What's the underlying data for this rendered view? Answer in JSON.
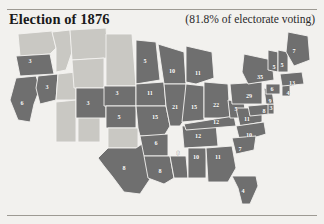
{
  "header": {
    "title": "Election of 1876",
    "turnout_note": "(81.8% of electorate voting)"
  },
  "map": {
    "shaded_color": "#6f6f6f",
    "unshaded_color": "#c9c8c3",
    "border_color": "#f4f3f0",
    "label_color": "#ffffff",
    "states": [
      {
        "code": "WA",
        "name": "Washington Territory",
        "ev": "",
        "shaded": false,
        "lx": 33,
        "ly": 16
      },
      {
        "code": "OR",
        "name": "Oregon",
        "ev": "3",
        "shaded": true,
        "lx": 30,
        "ly": 36
      },
      {
        "code": "CA",
        "name": "California",
        "ev": "6",
        "shaded": true,
        "lx": 22,
        "ly": 78
      },
      {
        "code": "NV",
        "name": "Nevada",
        "ev": "3",
        "shaded": true,
        "lx": 47,
        "ly": 62
      },
      {
        "code": "ID",
        "name": "Idaho Territory",
        "ev": "",
        "shaded": false,
        "lx": 58,
        "ly": 34
      },
      {
        "code": "MT",
        "name": "Montana Territory",
        "ev": "",
        "shaded": false,
        "lx": 78,
        "ly": 20
      },
      {
        "code": "UT",
        "name": "Utah Territory",
        "ev": "",
        "shaded": false,
        "lx": 62,
        "ly": 72
      },
      {
        "code": "AZ",
        "name": "Arizona Territory",
        "ev": "",
        "shaded": false,
        "lx": 55,
        "ly": 103
      },
      {
        "code": "NM",
        "name": "New Mexico Territory",
        "ev": "",
        "shaded": false,
        "lx": 82,
        "ly": 105
      },
      {
        "code": "WY",
        "name": "Wyoming Territory",
        "ev": "",
        "shaded": false,
        "lx": 86,
        "ly": 52
      },
      {
        "code": "CO",
        "name": "Colorado",
        "ev": "3",
        "shaded": true,
        "lx": 88,
        "ly": 78
      },
      {
        "code": "DT",
        "name": "Dakota Territory",
        "ev": "",
        "shaded": false,
        "lx": 114,
        "ly": 36
      },
      {
        "code": "NE",
        "name": "Nebraska",
        "ev": "3",
        "shaded": true,
        "lx": 117,
        "ly": 68
      },
      {
        "code": "KS",
        "name": "Kansas",
        "ev": "5",
        "shaded": true,
        "lx": 119,
        "ly": 92
      },
      {
        "code": "IT",
        "name": "Indian Territory",
        "ev": "",
        "shaded": false,
        "lx": 122,
        "ly": 112
      },
      {
        "code": "TX",
        "name": "Texas",
        "ev": "8",
        "shaded": true,
        "lx": 124,
        "ly": 143
      },
      {
        "code": "MN",
        "name": "Minnesota",
        "ev": "5",
        "shaded": true,
        "lx": 145,
        "ly": 36
      },
      {
        "code": "IA",
        "name": "Iowa",
        "ev": "11",
        "shaded": true,
        "lx": 150,
        "ly": 68
      },
      {
        "code": "MO",
        "name": "Missouri",
        "ev": "15",
        "shaded": true,
        "lx": 155,
        "ly": 92
      },
      {
        "code": "AR",
        "name": "Arkansas",
        "ev": "6",
        "shaded": true,
        "lx": 156,
        "ly": 118
      },
      {
        "code": "LA",
        "name": "Louisiana",
        "ev": "8",
        "shaded": true,
        "lx": 160,
        "ly": 146
      },
      {
        "code": "WI",
        "name": "Wisconsin",
        "ev": "10",
        "shaded": true,
        "lx": 172,
        "ly": 46
      },
      {
        "code": "IL",
        "name": "Illinois",
        "ev": "21",
        "shaded": true,
        "lx": 175,
        "ly": 82
      },
      {
        "code": "MS",
        "name": "Mississippi",
        "ev": "8",
        "shaded": true,
        "lx": 178,
        "ly": 128
      },
      {
        "code": "MI",
        "name": "Michigan",
        "ev": "11",
        "shaded": true,
        "lx": 198,
        "ly": 48
      },
      {
        "code": "IN",
        "name": "Indiana",
        "ev": "15",
        "shaded": true,
        "lx": 194,
        "ly": 82
      },
      {
        "code": "TN",
        "name": "Tennessee",
        "ev": "12",
        "shaded": true,
        "lx": 198,
        "ly": 111
      },
      {
        "code": "AL",
        "name": "Alabama",
        "ev": "10",
        "shaded": true,
        "lx": 196,
        "ly": 132
      },
      {
        "code": "OH",
        "name": "Ohio",
        "ev": "22",
        "shaded": true,
        "lx": 216,
        "ly": 80
      },
      {
        "code": "KY",
        "name": "Kentucky",
        "ev": "12",
        "shaded": true,
        "lx": 216,
        "ly": 97
      },
      {
        "code": "GA",
        "name": "Georgia",
        "ev": "11",
        "shaded": true,
        "lx": 218,
        "ly": 132
      },
      {
        "code": "FL",
        "name": "Florida",
        "ev": "4",
        "shaded": true,
        "lx": 243,
        "ly": 166
      },
      {
        "code": "WV",
        "name": "West Virginia",
        "ev": "5",
        "shaded": true,
        "lx": 236,
        "ly": 84
      },
      {
        "code": "VA",
        "name": "Virginia",
        "ev": "11",
        "shaded": true,
        "lx": 247,
        "ly": 94
      },
      {
        "code": "NC",
        "name": "North Carolina",
        "ev": "10",
        "shaded": true,
        "lx": 249,
        "ly": 110
      },
      {
        "code": "SC",
        "name": "South Carolina",
        "ev": "7",
        "shaded": true,
        "lx": 240,
        "ly": 124
      },
      {
        "code": "PA",
        "name": "Pennsylvania",
        "ev": "29",
        "shaded": true,
        "lx": 249,
        "ly": 71
      },
      {
        "code": "NY",
        "name": "New York",
        "ev": "35",
        "shaded": true,
        "lx": 260,
        "ly": 52
      },
      {
        "code": "MD",
        "name": "Maryland",
        "ev": "8",
        "shaded": true,
        "lx": 264,
        "ly": 86
      },
      {
        "code": "DE",
        "name": "Delaware",
        "ev": "3",
        "shaded": true,
        "lx": 271,
        "ly": 83
      },
      {
        "code": "NJ",
        "name": "New Jersey",
        "ev": "9",
        "shaded": true,
        "lx": 270,
        "ly": 76
      },
      {
        "code": "CT",
        "name": "Connecticut",
        "ev": "6",
        "shaded": true,
        "lx": 272,
        "ly": 64
      },
      {
        "code": "RI",
        "name": "Rhode Island",
        "ev": "4",
        "shaded": true,
        "lx": 288,
        "ly": 68
      },
      {
        "code": "MA",
        "name": "Massachusetts",
        "ev": "13",
        "shaded": true,
        "lx": 292,
        "ly": 58
      },
      {
        "code": "VT",
        "name": "Vermont",
        "ev": "5",
        "shaded": true,
        "lx": 274,
        "ly": 42
      },
      {
        "code": "NH",
        "name": "New Hampshire",
        "ev": "5",
        "shaded": true,
        "lx": 282,
        "ly": 40
      },
      {
        "code": "ME",
        "name": "Maine",
        "ev": "7",
        "shaded": true,
        "lx": 294,
        "ly": 26
      }
    ]
  }
}
